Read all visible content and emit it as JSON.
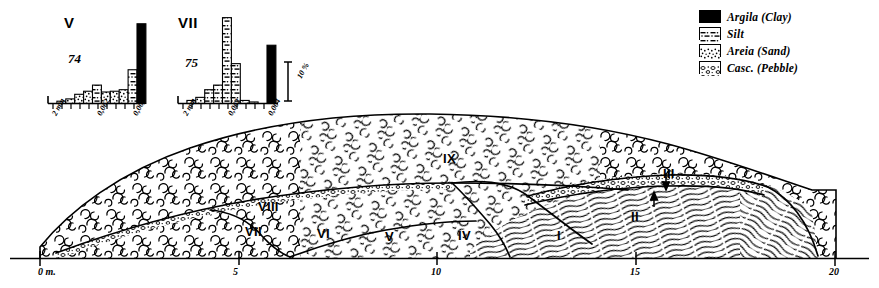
{
  "figure": {
    "kind": "geological-cross-section",
    "colors": {
      "ink": "#000000",
      "paper": "#ffffff"
    }
  },
  "histograms": [
    {
      "panel_label": "V",
      "sample_number": "74",
      "axis_ticks": [
        "2 mm",
        "0,062",
        "0,004"
      ],
      "chart": {
        "type": "bar",
        "title": "V",
        "categories": [
          "2 mm",
          "",
          "",
          "",
          "",
          "0,062",
          "",
          "",
          "",
          "",
          "0,004"
        ],
        "values": [
          0,
          1.5,
          3,
          6,
          8,
          12,
          7.5,
          8,
          9,
          22,
          52
        ],
        "fills": [
          "sand",
          "sand",
          "sand",
          "sand",
          "sand",
          "silt",
          "sand",
          "sand",
          "sand",
          "silt",
          "clay"
        ],
        "xlabel": "",
        "ylabel": "%",
        "ylim": [
          0,
          60
        ],
        "grid": false
      }
    },
    {
      "panel_label": "VII",
      "sample_number": "75",
      "axis_ticks": [
        "2 mm",
        "0,062",
        "0,004"
      ],
      "scale_bar_label": "10 %",
      "chart": {
        "type": "bar",
        "title": "VII",
        "categories": [
          "2 mm",
          "",
          "",
          "",
          "",
          "0,062",
          "",
          "",
          "",
          "",
          "0,004"
        ],
        "values": [
          0,
          2,
          4,
          9,
          12,
          56,
          26,
          2,
          1,
          0,
          38
        ],
        "fills": [
          "sand",
          "sand",
          "sand",
          "silt",
          "silt",
          "silt",
          "silt",
          "sand",
          "sand",
          "sand",
          "clay"
        ],
        "xlabel": "",
        "ylabel": "%",
        "ylim": [
          0,
          60
        ],
        "grid": false
      }
    }
  ],
  "legend": {
    "items": [
      {
        "label": "Argila (Clay)",
        "pattern": "clay",
        "swatch_name": "clay-swatch"
      },
      {
        "label": "Silt",
        "pattern": "silt",
        "swatch_name": "silt-swatch"
      },
      {
        "label": "Areia (Sand)",
        "pattern": "sand",
        "swatch_name": "sand-swatch"
      },
      {
        "label": "Casc. (Pebble)",
        "pattern": "pebble",
        "swatch_name": "pebble-swatch"
      }
    ]
  },
  "section": {
    "units": [
      {
        "label": "I",
        "x": 557,
        "y": 228
      },
      {
        "label": "II",
        "x": 631,
        "y": 209
      },
      {
        "label": "III",
        "x": 663,
        "y": 166
      },
      {
        "label": "IV",
        "x": 458,
        "y": 228
      },
      {
        "label": "V",
        "x": 385,
        "y": 229
      },
      {
        "label": "VI",
        "x": 317,
        "y": 226
      },
      {
        "label": "VII",
        "x": 245,
        "y": 224
      },
      {
        "label": "VIII",
        "x": 258,
        "y": 199
      },
      {
        "label": "IX",
        "x": 443,
        "y": 151
      }
    ],
    "axis": {
      "ticks": [
        {
          "label": "0 m.",
          "x": 40
        },
        {
          "label": "5",
          "x": 239
        },
        {
          "label": "10",
          "x": 437
        },
        {
          "label": "15",
          "x": 636
        },
        {
          "label": "20",
          "x": 835
        }
      ]
    }
  }
}
